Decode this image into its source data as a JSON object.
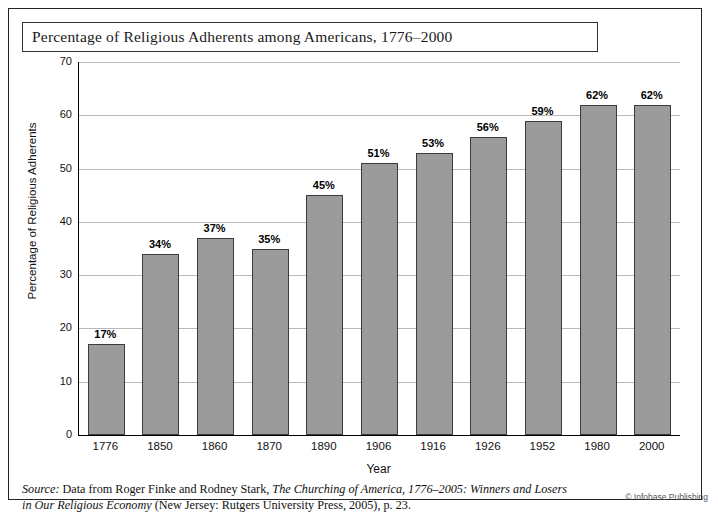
{
  "title": "Percentage of Religious Adherents among Americans, 1776–2000",
  "source": {
    "label": "Source:",
    "line1_a": " Data from Roger Finke and Rodney Stark, ",
    "line1_italic": "The Churching of America, 1776–2005: Winners and Losers",
    "line2_italic": "in Our Religious Economy",
    "line2_b": " (New Jersey: Rutgers University Press, 2005), p. 23."
  },
  "credit": "© Infobase Publishing",
  "colors": {
    "bar_fill": "#9b9b9b",
    "bar_stroke": "#3c3c3c",
    "grid": "#b9b9b9",
    "axis": "#000000",
    "frame": "#222222"
  },
  "chart_data": {
    "type": "bar",
    "title": "Percentage of Religious Adherents among Americans, 1776–2000",
    "xlabel": "Year",
    "ylabel": "Percentage of Religious Adherents",
    "categories": [
      "1776",
      "1850",
      "1860",
      "1870",
      "1890",
      "1906",
      "1916",
      "1926",
      "1952",
      "1980",
      "2000"
    ],
    "values": [
      17,
      34,
      37,
      35,
      45,
      51,
      53,
      56,
      59,
      62,
      62
    ],
    "value_labels": [
      "17%",
      "34%",
      "37%",
      "35%",
      "45%",
      "51%",
      "53%",
      "56%",
      "59%",
      "62%",
      "62%"
    ],
    "ylim": [
      0,
      70
    ],
    "yticks": [
      0,
      10,
      20,
      30,
      40,
      50,
      60,
      70
    ],
    "ytick_labels": [
      "0",
      "10",
      "20",
      "30",
      "40",
      "50",
      "60",
      "70"
    ],
    "grid": true,
    "legend": "none"
  }
}
